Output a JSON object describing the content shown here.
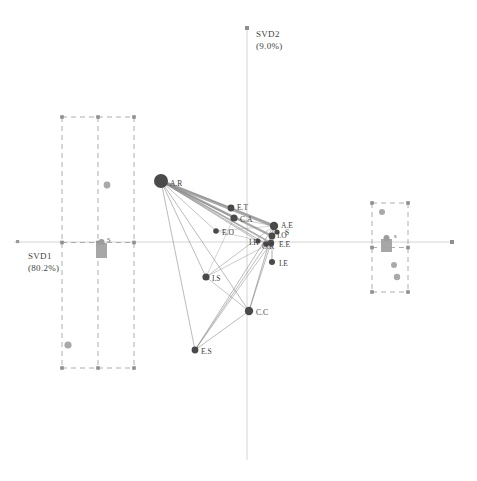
{
  "figure": {
    "type": "biplot-network",
    "background": "#ffffff",
    "axis_color": "#c9c9c9",
    "node_color": "#4a4a4a",
    "edge_color": "#8d8d8d",
    "box_color": "#9b9b9b",
    "marker_gray": "#9a9a9a"
  },
  "axes": {
    "x": {
      "name": "SVD1",
      "pct": "(80.2%)",
      "label_x": 28,
      "label_y": 250
    },
    "y": {
      "name": "SVD2",
      "pct": "(9.0%)",
      "label_x": 256,
      "label_y": 28
    }
  },
  "chart_data": {
    "type": "scatter",
    "title": "",
    "xlabel": "SVD1 (80.2%)",
    "ylabel": "SVD2 (9.0%)",
    "grid": false,
    "legend": "none",
    "origin_px": [
      247,
      242
    ],
    "nodes": [
      {
        "id": "A.R",
        "label": "A.R",
        "x": 161,
        "y": 181,
        "r": 7.0,
        "lx": 170,
        "ly": 185
      },
      {
        "id": "E.T",
        "label": "E.T",
        "x": 231,
        "y": 208,
        "r": 3.4,
        "lx": 237,
        "ly": 209
      },
      {
        "id": "C.A",
        "label": "C.A",
        "x": 234,
        "y": 218,
        "r": 3.6,
        "lx": 240,
        "ly": 221
      },
      {
        "id": "E.O",
        "label": "E.O",
        "x": 216,
        "y": 231,
        "r": 2.8,
        "lx": 222,
        "ly": 234
      },
      {
        "id": "A.E",
        "label": "A.E",
        "x": 274,
        "y": 226,
        "r": 4.2,
        "lx": 281,
        "ly": 227
      },
      {
        "id": "I.O",
        "label": "I.O",
        "x": 272,
        "y": 236,
        "r": 3.4,
        "lx": 277,
        "ly": 237
      },
      {
        "id": "S.x",
        "label": "S",
        "x": 277,
        "y": 232,
        "r": 2.6,
        "lx": 285,
        "ly": 234
      },
      {
        "id": "E.E",
        "label": "E.E",
        "x": 271,
        "y": 243,
        "r": 3.2,
        "lx": 279,
        "ly": 246
      },
      {
        "id": "H.x",
        "label": "I.H",
        "x": 258,
        "y": 241,
        "r": 2.6,
        "lx": 249,
        "ly": 244
      },
      {
        "id": "O.R",
        "label": "O.R",
        "x": 266,
        "y": 244,
        "r": 2.8,
        "lx": 262,
        "ly": 248
      },
      {
        "id": "I.E",
        "label": "I.E",
        "x": 272,
        "y": 262,
        "r": 3.0,
        "lx": 279,
        "ly": 265
      },
      {
        "id": "I.S",
        "label": "I.S",
        "x": 206,
        "y": 277,
        "r": 3.6,
        "lx": 212,
        "ly": 280
      },
      {
        "id": "C.C",
        "label": "C.C",
        "x": 249,
        "y": 311,
        "r": 4.2,
        "lx": 256,
        "ly": 314
      },
      {
        "id": "E.S",
        "label": "E.S",
        "x": 195,
        "y": 350,
        "r": 3.4,
        "lx": 201,
        "ly": 353
      }
    ],
    "edges": [
      {
        "from": "A.R",
        "to": "A.E",
        "w": 3.2
      },
      {
        "from": "A.R",
        "to": "I.O",
        "w": 2.4
      },
      {
        "from": "A.R",
        "to": "E.E",
        "w": 1.6
      },
      {
        "from": "A.R",
        "to": "C.A",
        "w": 1.2
      },
      {
        "from": "A.R",
        "to": "E.T",
        "w": 1.0
      },
      {
        "from": "A.R",
        "to": "O.R",
        "w": 0.9
      },
      {
        "from": "A.R",
        "to": "H.x",
        "w": 0.8
      },
      {
        "from": "A.R",
        "to": "I.S",
        "w": 0.8
      },
      {
        "from": "A.R",
        "to": "C.C",
        "w": 0.8
      },
      {
        "from": "A.R",
        "to": "E.S",
        "w": 0.8
      },
      {
        "from": "A.R",
        "to": "E.O",
        "w": 0.7
      },
      {
        "from": "E.S",
        "to": "A.E",
        "w": 0.8
      },
      {
        "from": "E.S",
        "to": "I.O",
        "w": 0.8
      },
      {
        "from": "E.S",
        "to": "C.C",
        "w": 0.8
      },
      {
        "from": "E.S",
        "to": "E.E",
        "w": 0.7
      },
      {
        "from": "C.C",
        "to": "A.E",
        "w": 0.9
      },
      {
        "from": "C.C",
        "to": "E.E",
        "w": 0.8
      },
      {
        "from": "C.C",
        "to": "I.S",
        "w": 0.7
      },
      {
        "from": "I.S",
        "to": "A.E",
        "w": 0.7
      },
      {
        "from": "I.S",
        "to": "E.E",
        "w": 0.6
      },
      {
        "from": "I.S",
        "to": "C.A",
        "w": 0.5
      },
      {
        "from": "E.T",
        "to": "A.E",
        "w": 0.6
      },
      {
        "from": "C.A",
        "to": "A.E",
        "w": 0.6
      },
      {
        "from": "E.O",
        "to": "A.E",
        "w": 0.5
      },
      {
        "from": "E.O",
        "to": "E.E",
        "w": 0.5
      },
      {
        "from": "I.E",
        "to": "A.E",
        "w": 0.5
      },
      {
        "from": "I.E",
        "to": "E.E",
        "w": 0.5
      }
    ],
    "boxes": [
      {
        "name": "left-dashed-grid",
        "x": 62,
        "y": 117,
        "w": 72,
        "h": 251,
        "cols": 2,
        "rows": 2,
        "points": [
          {
            "x": 107,
            "y": 185,
            "r": 3.4
          },
          {
            "x": 68,
            "y": 345,
            "r": 3.6
          }
        ],
        "marker": {
          "x": 96,
          "y": 243,
          "w": 11,
          "h": 15,
          "label": "S",
          "lx": 107,
          "ly": 236
        }
      },
      {
        "name": "right-dashed-grid",
        "x": 372,
        "y": 203,
        "w": 36,
        "h": 89,
        "cols": 1,
        "rows": 2,
        "points": [
          {
            "x": 382,
            "y": 212,
            "r": 3.0
          },
          {
            "x": 394,
            "y": 265,
            "r": 3.0
          },
          {
            "x": 397,
            "y": 277,
            "r": 3.2
          }
        ],
        "marker": {
          "x": 381,
          "y": 239,
          "w": 11,
          "h": 13,
          "label": "s",
          "lx": 394,
          "ly": 232
        }
      }
    ]
  }
}
